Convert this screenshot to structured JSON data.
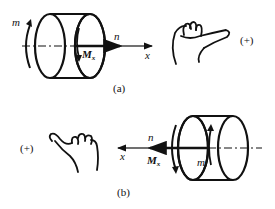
{
  "figure_a": {
    "caption": "(a)",
    "sign": "(+)",
    "labels": {
      "moment_m": "m",
      "torque": "M",
      "torque_sub": "x",
      "normal": "n",
      "axis": "x"
    }
  },
  "figure_b": {
    "caption": "(b)",
    "sign": "(+)",
    "labels": {
      "moment_m": "m",
      "torque": "M",
      "torque_sub": "x",
      "normal": "n",
      "axis": "x"
    }
  },
  "colors": {
    "stroke": "#111111",
    "background": "#ffffff"
  }
}
